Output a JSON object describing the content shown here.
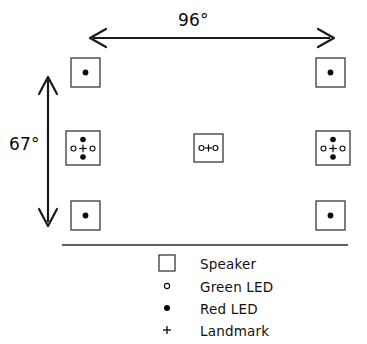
{
  "figure": {
    "background_color": "#ffffff",
    "stroke_color": "#1a1a1a",
    "text_color": "#111111"
  },
  "dimensions": {
    "horizontal": {
      "label": "96°",
      "value": 96,
      "unit": "degrees",
      "orientation": "horizontal",
      "arrow_style": "double-headed"
    },
    "vertical": {
      "label": "67°",
      "value": 67,
      "unit": "degrees",
      "orientation": "vertical",
      "arrow_style": "double-headed"
    }
  },
  "array": {
    "rows": 3,
    "columns": 3,
    "speakers": [
      {
        "id": "speaker-top-left",
        "row": "top",
        "column": "left",
        "green_leds": 0,
        "red_leds": 1,
        "landmark": false,
        "led_layout": "single-center-red"
      },
      {
        "id": "speaker-top-right",
        "row": "top",
        "column": "right",
        "green_leds": 0,
        "red_leds": 1,
        "landmark": false,
        "led_layout": "single-center-red"
      },
      {
        "id": "speaker-middle-left",
        "row": "middle",
        "column": "left",
        "green_leds": 2,
        "red_leds": 2,
        "landmark": true,
        "led_layout": "diamond-red-top-bottom-green-left-right"
      },
      {
        "id": "speaker-middle-center",
        "row": "middle",
        "column": "center",
        "green_leds": 2,
        "red_leds": 0,
        "landmark": true,
        "led_layout": "horizontal-green-left-right"
      },
      {
        "id": "speaker-middle-right",
        "row": "middle",
        "column": "right",
        "green_leds": 2,
        "red_leds": 2,
        "landmark": true,
        "led_layout": "diamond-red-top-bottom-green-left-right"
      },
      {
        "id": "speaker-bottom-left",
        "row": "bottom",
        "column": "left",
        "green_leds": 0,
        "red_leds": 1,
        "landmark": false,
        "led_layout": "single-center-red"
      },
      {
        "id": "speaker-bottom-right",
        "row": "bottom",
        "column": "right",
        "green_leds": 0,
        "red_leds": 1,
        "landmark": false,
        "led_layout": "single-center-red"
      }
    ]
  },
  "legend": {
    "items": [
      {
        "symbol": "square-outline",
        "label": "Speaker"
      },
      {
        "symbol": "open-circle",
        "label": "Green  LED"
      },
      {
        "symbol": "filled-circle",
        "label": "Red  LED"
      },
      {
        "symbol": "plus-sign",
        "label": "Landmark"
      }
    ]
  }
}
